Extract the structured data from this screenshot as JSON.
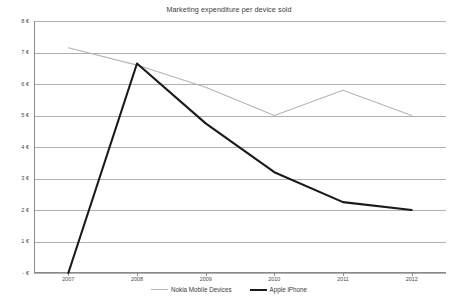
{
  "chart_data": {
    "type": "line",
    "title": "Marketing expenditure per device sold",
    "xlabel": "",
    "ylabel": "",
    "x": [
      "2007",
      "2008",
      "2009",
      "2010",
      "2011",
      "2012"
    ],
    "categories": [
      "2007",
      "2008",
      "2009",
      "2010",
      "2011",
      "2012"
    ],
    "ylim": [
      0,
      8
    ],
    "ytick_labels": [
      "8 €",
      "7 €",
      "6 €",
      "5 €",
      "4 €",
      "3 €",
      "2 €",
      "1 €",
      "- €"
    ],
    "ytick_values": [
      8,
      7,
      6,
      5,
      4,
      3,
      2,
      1,
      0
    ],
    "grid": true,
    "legend_position": "bottom",
    "series": [
      {
        "name": "Nokia Mobile Devices",
        "color": "#b5b5b5",
        "values": [
          7.15,
          6.6,
          5.9,
          5.0,
          5.8,
          5.0
        ]
      },
      {
        "name": "Apple iPhone",
        "color": "#1a1a1a",
        "values": [
          0.0,
          6.65,
          4.75,
          3.2,
          2.25,
          2.0
        ]
      }
    ]
  },
  "legend": {
    "entries": [
      {
        "label": "Nokia Mobile Devices",
        "color": "#b5b5b5",
        "width": "1.1px"
      },
      {
        "label": "Apple iPhone",
        "color": "#1a1a1a",
        "width": "2.1px"
      }
    ]
  }
}
